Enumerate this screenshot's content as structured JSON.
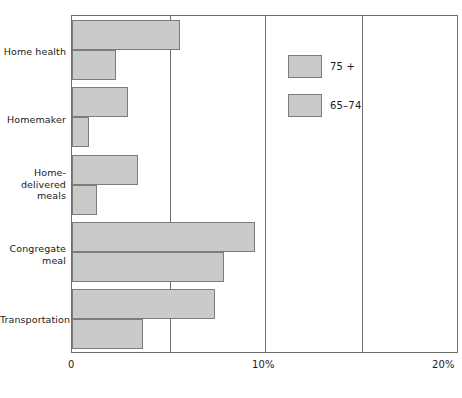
{
  "chart_data": {
    "type": "bar",
    "orientation": "horizontal",
    "title": "",
    "subtitle": "",
    "xlabel": "",
    "ylabel": "",
    "xlim": [
      0,
      20
    ],
    "xticks": [
      0,
      10,
      20
    ],
    "xtick_labels": [
      "0",
      "10%",
      "20%"
    ],
    "grid": true,
    "gridlines_at": [
      5,
      10,
      15
    ],
    "legend_position": "upper right",
    "categories": [
      "Home health",
      "Homemaker",
      "Home-delivered meals",
      "Congregate meal",
      "Transportation"
    ],
    "category_label_lines": [
      [
        "Home health"
      ],
      [
        "Homemaker"
      ],
      [
        "Home-",
        "delivered",
        "meals"
      ],
      [
        "Congregate",
        "meal"
      ],
      [
        "Transportation"
      ]
    ],
    "series": [
      {
        "name": "75 +",
        "color": "#cacaca",
        "values": [
          5.6,
          2.9,
          3.4,
          9.5,
          7.4
        ]
      },
      {
        "name": "65-74",
        "color": "#cacaca",
        "values": [
          2.3,
          0.9,
          1.3,
          7.9,
          3.7
        ]
      }
    ]
  },
  "legend": {
    "items": [
      {
        "label": "75 +",
        "swatch_name": "legend-swatch-75-plus"
      },
      {
        "label": "65–74",
        "swatch_name": "legend-swatch-65-74"
      }
    ]
  },
  "axis": {
    "x_tick_0": "0",
    "x_tick_10": "10%",
    "x_tick_20": "20%"
  },
  "labels": {
    "home_health": "Home health",
    "homemaker": "Homemaker",
    "home_delivered_1": "Home-",
    "home_delivered_2": "delivered",
    "home_delivered_3": "meals",
    "congregate_1": "Congregate",
    "congregate_2": "meal",
    "transportation": "Transportation"
  },
  "colors": {
    "bar_fill": "#cacaca",
    "bar_stroke": "#7d7d7d",
    "axis": "#6e6e6e",
    "text": "#1a1a1a",
    "background": "#ffffff"
  }
}
